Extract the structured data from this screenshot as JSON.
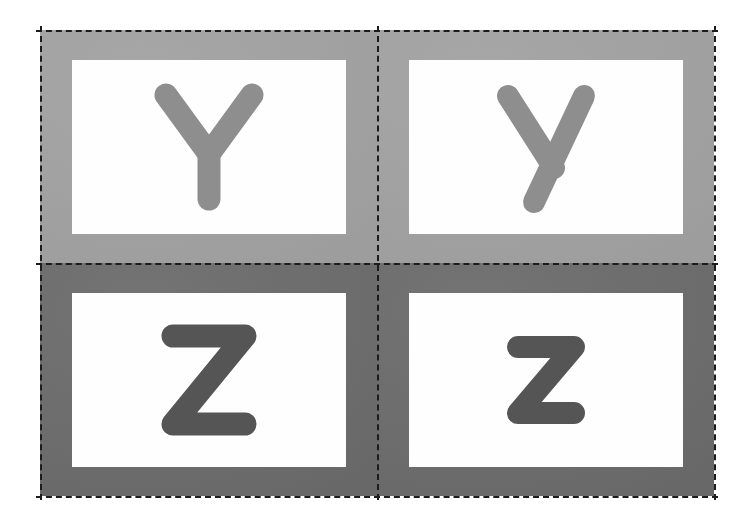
{
  "sheet": {
    "title": "Alphabet Flashcards",
    "description": "Printable 2 by 2 flashcard sheet with dashed cutting guides",
    "rows": 2,
    "columns": 2,
    "cut_guide_style": "dashed",
    "cut_guide_color": "#1c1c1c"
  },
  "palette": {
    "page_background": "#ffffff",
    "panel_light": "#a2a2a2",
    "panel_dark": "#6e6e6e",
    "card_background": "#fefefe",
    "letter_light": "#8e8e8e",
    "letter_dark": "#555555"
  },
  "cards": [
    {
      "id": "card-y-upper",
      "letter": "Y",
      "letter_case": "uppercase",
      "panel_color": "#a2a2a2",
      "letter_color": "#8e8e8e",
      "position": "top-left"
    },
    {
      "id": "card-y-lower",
      "letter": "y",
      "letter_case": "lowercase",
      "panel_color": "#a2a2a2",
      "letter_color": "#8e8e8e",
      "position": "top-right"
    },
    {
      "id": "card-z-upper",
      "letter": "Z",
      "letter_case": "uppercase",
      "panel_color": "#6e6e6e",
      "letter_color": "#555555",
      "position": "bottom-left"
    },
    {
      "id": "card-z-lower",
      "letter": "z",
      "letter_case": "lowercase",
      "panel_color": "#6e6e6e",
      "letter_color": "#555555",
      "position": "bottom-right"
    }
  ]
}
